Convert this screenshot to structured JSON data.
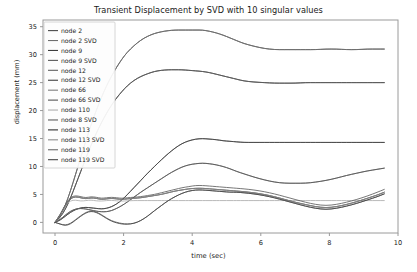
{
  "chart_data": {
    "type": "line",
    "title": "Transient Displacement by SVD with 10 singular values",
    "xlabel": "time (sec)",
    "ylabel": "displacement (mm)",
    "xlim": [
      -0.35,
      10.0
    ],
    "ylim": [
      -1.9,
      36.2
    ],
    "xticks": [
      0,
      2,
      4,
      6,
      8,
      10
    ],
    "yticks": [
      0,
      5,
      10,
      15,
      20,
      25,
      30,
      35
    ],
    "grid": false,
    "legend_position": "upper left",
    "x": [
      0,
      0.15,
      0.3,
      0.45,
      0.6,
      0.75,
      0.9,
      1.05,
      1.2,
      1.35,
      1.5,
      1.65,
      1.8,
      1.95,
      2.1,
      2.3,
      2.5,
      2.7,
      2.9,
      3.1,
      3.3,
      3.5,
      3.7,
      3.9,
      4.1,
      4.3,
      4.5,
      4.7,
      4.9,
      5.1,
      5.3,
      5.5,
      5.8,
      6.1,
      6.4,
      6.7,
      7.0,
      7.3,
      7.6,
      7.9,
      8.2,
      8.5,
      8.8,
      9.1,
      9.4,
      9.6
    ],
    "series": [
      {
        "name": "node 2",
        "color": "#4a4a4a",
        "values": [
          0,
          1.2,
          3.0,
          5.6,
          8.6,
          11.6,
          14.6,
          17.4,
          20.0,
          22.3,
          24.4,
          26.2,
          27.8,
          29.2,
          30.4,
          31.6,
          32.6,
          33.3,
          33.8,
          34.1,
          34.3,
          34.4,
          34.4,
          34.4,
          34.4,
          34.4,
          34.2,
          33.9,
          33.5,
          33.0,
          32.5,
          32.0,
          31.5,
          31.1,
          30.9,
          30.9,
          30.9,
          30.9,
          30.9,
          31.0,
          31.0,
          30.9,
          30.9,
          31.0,
          31.0,
          31.0
        ]
      },
      {
        "name": "node 2 SVD",
        "color": "#6f6f6f",
        "values": [
          0,
          1.2,
          3.0,
          5.6,
          8.6,
          11.6,
          14.6,
          17.4,
          20.0,
          22.3,
          24.4,
          26.2,
          27.8,
          29.2,
          30.4,
          31.6,
          32.6,
          33.3,
          33.8,
          34.1,
          34.3,
          34.4,
          34.4,
          34.4,
          34.4,
          34.4,
          34.2,
          33.9,
          33.5,
          33.0,
          32.5,
          32.0,
          31.5,
          31.1,
          30.9,
          30.9,
          30.9,
          30.9,
          30.9,
          31.0,
          31.0,
          30.9,
          30.9,
          31.0,
          31.0,
          31.0
        ]
      },
      {
        "name": "node 9",
        "color": "#3d3d3d",
        "values": [
          0,
          0.9,
          2.3,
          4.3,
          6.7,
          9.1,
          11.5,
          13.8,
          15.9,
          17.8,
          19.5,
          21.0,
          22.3,
          23.4,
          24.4,
          25.4,
          26.1,
          26.6,
          27.0,
          27.2,
          27.3,
          27.3,
          27.3,
          27.2,
          27.1,
          27.0,
          26.8,
          26.5,
          26.2,
          25.9,
          25.6,
          25.3,
          25.1,
          25.0,
          24.9,
          24.9,
          24.9,
          25.0,
          25.0,
          25.0,
          25.0,
          25.0,
          25.0,
          25.0,
          25.0,
          25.0
        ]
      },
      {
        "name": "node 9 SVD",
        "color": "#5a5a5a",
        "values": [
          0,
          0.9,
          2.3,
          4.3,
          6.7,
          9.1,
          11.5,
          13.8,
          15.9,
          17.8,
          19.5,
          21.0,
          22.3,
          23.4,
          24.4,
          25.4,
          26.1,
          26.6,
          27.0,
          27.2,
          27.3,
          27.3,
          27.3,
          27.2,
          27.1,
          27.0,
          26.8,
          26.5,
          26.2,
          25.9,
          25.6,
          25.3,
          25.1,
          25.0,
          24.9,
          24.9,
          24.9,
          25.0,
          25.0,
          25.0,
          25.0,
          25.0,
          25.0,
          25.0,
          25.0,
          25.0
        ]
      },
      {
        "name": "node 12",
        "color": "#636363",
        "values": [
          0,
          0.4,
          1.1,
          1.8,
          2.3,
          2.6,
          2.7,
          2.6,
          2.5,
          2.4,
          2.5,
          2.8,
          3.3,
          4.0,
          4.9,
          6.2,
          7.5,
          8.8,
          10.0,
          11.2,
          12.3,
          13.3,
          14.1,
          14.6,
          14.9,
          15.0,
          14.9,
          14.8,
          14.6,
          14.5,
          14.4,
          14.3,
          14.3,
          14.3,
          14.3,
          14.3,
          14.3,
          14.3,
          14.3,
          14.3,
          14.3,
          14.3,
          14.3,
          14.3,
          14.3,
          14.3
        ]
      },
      {
        "name": "node 12 SVD",
        "color": "#424242",
        "values": [
          0,
          0.4,
          1.1,
          1.8,
          2.3,
          2.6,
          2.7,
          2.6,
          2.5,
          2.4,
          2.5,
          2.8,
          3.3,
          4.0,
          4.9,
          6.2,
          7.5,
          8.8,
          10.0,
          11.2,
          12.3,
          13.3,
          14.1,
          14.6,
          14.9,
          15.0,
          14.9,
          14.8,
          14.6,
          14.5,
          14.4,
          14.3,
          14.3,
          14.3,
          14.3,
          14.3,
          14.3,
          14.3,
          14.3,
          14.3,
          14.3,
          14.3,
          14.3,
          14.3,
          14.3,
          14.3
        ]
      },
      {
        "name": "node 66",
        "color": "#7d7d7d",
        "values": [
          0,
          0.5,
          1.3,
          2.0,
          2.4,
          2.5,
          2.4,
          2.2,
          2.0,
          1.9,
          1.9,
          2.1,
          2.5,
          3.0,
          3.6,
          4.5,
          5.4,
          6.2,
          7.0,
          7.8,
          8.6,
          9.3,
          9.9,
          10.3,
          10.5,
          10.6,
          10.5,
          10.3,
          10.0,
          9.6,
          9.1,
          8.7,
          8.1,
          7.6,
          7.2,
          7.0,
          7.0,
          7.0,
          7.2,
          7.5,
          7.9,
          8.4,
          8.8,
          9.2,
          9.5,
          9.7
        ]
      },
      {
        "name": "node 66 SVD",
        "color": "#555555",
        "values": [
          0,
          0.5,
          1.3,
          2.0,
          2.4,
          2.5,
          2.4,
          2.2,
          2.0,
          1.9,
          1.9,
          2.1,
          2.5,
          3.0,
          3.6,
          4.5,
          5.4,
          6.2,
          7.0,
          7.8,
          8.6,
          9.3,
          9.9,
          10.3,
          10.5,
          10.6,
          10.5,
          10.3,
          10.0,
          9.6,
          9.1,
          8.7,
          8.1,
          7.6,
          7.2,
          7.0,
          7.0,
          7.0,
          7.2,
          7.5,
          7.9,
          8.4,
          8.8,
          9.2,
          9.5,
          9.7
        ]
      },
      {
        "name": "node 110",
        "color": "#aeaeae",
        "values": [
          0,
          1.4,
          3.0,
          3.9,
          4.0,
          3.8,
          3.9,
          4.0,
          3.85,
          3.8,
          3.9,
          3.95,
          3.85,
          3.8,
          3.85,
          3.9,
          3.9,
          3.9,
          3.9,
          3.9,
          3.9,
          3.9,
          3.9,
          3.9,
          3.9,
          3.9,
          3.9,
          3.9,
          3.9,
          3.9,
          3.9,
          3.9,
          3.9,
          3.9,
          3.9,
          3.9,
          3.9,
          3.9,
          3.9,
          3.9,
          3.9,
          3.9,
          3.9,
          3.9,
          3.9,
          3.9
        ]
      },
      {
        "name": "node 8 SVD",
        "color": "#5e5e5e",
        "values": [
          0,
          1.4,
          3.2,
          4.5,
          4.8,
          4.6,
          4.4,
          4.6,
          4.5,
          4.3,
          4.4,
          4.5,
          4.4,
          4.3,
          4.4,
          4.5,
          4.6,
          4.8,
          5.0,
          5.3,
          5.6,
          5.9,
          6.2,
          6.4,
          6.6,
          6.6,
          6.5,
          6.4,
          6.3,
          6.2,
          6.1,
          6.0,
          5.8,
          5.5,
          5.1,
          4.6,
          4.1,
          3.6,
          3.2,
          3.0,
          3.2,
          3.6,
          4.1,
          4.7,
          5.4,
          5.9
        ]
      },
      {
        "name": "node 113",
        "color": "#2f2f2f",
        "values": [
          0,
          1.3,
          3.0,
          4.3,
          4.6,
          4.4,
          4.2,
          4.4,
          4.3,
          4.1,
          4.2,
          4.3,
          4.2,
          4.1,
          4.2,
          4.3,
          4.4,
          4.6,
          4.8,
          5.0,
          5.3,
          5.6,
          5.8,
          6.0,
          6.1,
          6.1,
          6.0,
          5.9,
          5.8,
          5.7,
          5.6,
          5.5,
          5.3,
          5.0,
          4.6,
          4.1,
          3.6,
          3.2,
          2.8,
          2.6,
          2.8,
          3.2,
          3.7,
          4.3,
          4.9,
          5.4
        ]
      },
      {
        "name": "node 113 SVD",
        "color": "#8a8a8a",
        "values": [
          0,
          1.3,
          3.0,
          4.3,
          4.6,
          4.4,
          4.2,
          4.4,
          4.3,
          4.1,
          4.2,
          4.3,
          4.2,
          4.1,
          4.2,
          4.3,
          4.4,
          4.6,
          4.8,
          5.0,
          5.3,
          5.6,
          5.8,
          6.0,
          6.1,
          6.1,
          6.0,
          5.9,
          5.8,
          5.7,
          5.6,
          5.5,
          5.3,
          5.0,
          4.6,
          4.1,
          3.6,
          3.2,
          2.8,
          2.6,
          2.8,
          3.2,
          3.7,
          4.3,
          4.9,
          5.4
        ]
      },
      {
        "name": "node 119",
        "color": "#6a6a6a",
        "values": [
          0,
          -0.3,
          -0.5,
          -0.2,
          0.5,
          1.2,
          1.8,
          2.1,
          1.9,
          1.4,
          0.8,
          0.3,
          0.0,
          -0.2,
          -0.3,
          -0.2,
          0.3,
          1.1,
          2.1,
          3.0,
          3.9,
          4.6,
          5.2,
          5.6,
          5.8,
          5.8,
          5.7,
          5.6,
          5.5,
          5.4,
          5.4,
          5.3,
          5.1,
          4.8,
          4.4,
          3.9,
          3.4,
          2.9,
          2.5,
          2.3,
          2.5,
          2.9,
          3.4,
          4.0,
          4.6,
          5.1
        ]
      },
      {
        "name": "node 119 SVD",
        "color": "#474747",
        "values": [
          0,
          -0.3,
          -0.6,
          -0.3,
          0.4,
          1.1,
          1.7,
          2.0,
          1.8,
          1.3,
          0.7,
          0.2,
          -0.1,
          -0.3,
          -0.35,
          -0.2,
          0.3,
          1.1,
          2.1,
          3.0,
          3.9,
          4.6,
          5.2,
          5.6,
          5.8,
          5.8,
          5.7,
          5.6,
          5.5,
          5.4,
          5.4,
          5.3,
          5.1,
          4.8,
          4.4,
          3.9,
          3.4,
          2.9,
          2.5,
          2.3,
          2.5,
          2.9,
          3.4,
          4.0,
          4.6,
          5.1
        ]
      }
    ]
  }
}
